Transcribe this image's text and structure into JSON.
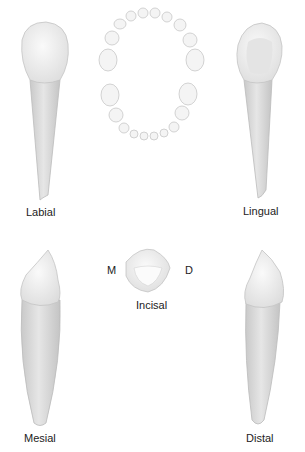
{
  "figure": {
    "views": {
      "labial": "Labial",
      "lingual": "Lingual",
      "mesial": "Mesial",
      "distal": "Distal",
      "incisal": "Incisal"
    },
    "incisal_markers": {
      "mesial": "M",
      "distal": "D"
    },
    "colors": {
      "crown": "#f1f1f1",
      "root": "#d6d6d6",
      "outline": "#bdbdbd",
      "text": "#222222"
    }
  }
}
